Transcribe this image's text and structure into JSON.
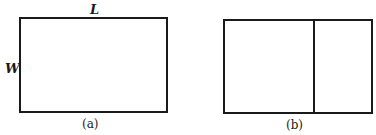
{
  "figure": {
    "panel_a": {
      "caption": "(a)",
      "length_label": "L",
      "width_label": "W"
    },
    "panel_b": {
      "caption": "(b)"
    }
  }
}
